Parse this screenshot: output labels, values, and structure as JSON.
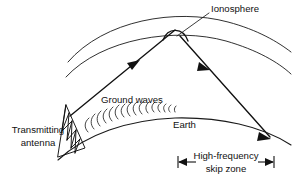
{
  "figure": {
    "title": "Ionospheric skip propagation diagram",
    "background_color": "#ffffff",
    "line_color": "#111111",
    "width": 292,
    "height": 179
  },
  "labels": {
    "ionosphere": "Ionosphere",
    "ground_waves": "Ground waves",
    "earth": "Earth",
    "transmitting_line1": "Transmitting",
    "transmitting_line2": "antenna",
    "skip_zone_line1": "High-frequency",
    "skip_zone_line2": "skip zone"
  },
  "elements": {
    "ionosphere_upper_arc": "upper ionosphere layer boundary arc",
    "ionosphere_lower_arc": "lower ionosphere layer boundary arc",
    "earth_surface_arc": "curved earth surface",
    "upgoing_ray": "transmitted sky wave ray travelling up to ionosphere",
    "downgoing_ray": "reflected sky wave ray returning to earth",
    "ground_wavelets": "series of small arcs depicting ground wave propagation",
    "antenna_tower": "lattice transmitting antenna tower",
    "skip_zone_dimension": "double headed dimension arrow marking skip zone",
    "ionosphere_leader": "leader line from ionosphere label to arc"
  }
}
